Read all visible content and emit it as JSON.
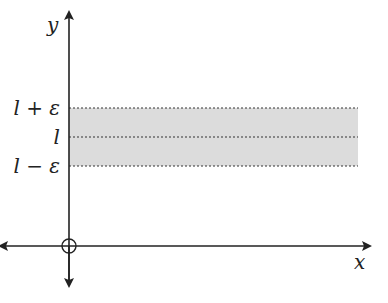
{
  "diagram": {
    "axes": {
      "x_label": "x",
      "y_label": "y"
    },
    "band": {
      "upper_label": "l + ε",
      "center_label": "l",
      "lower_label": "l − ε",
      "fill_color": "#dcdcdc",
      "line_color": "#333333"
    },
    "origin_marker": "circle"
  }
}
